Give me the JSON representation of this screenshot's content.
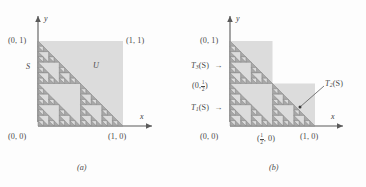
{
  "figure": {
    "type": "sierpinski-triangle-iterated-function-system",
    "panels": [
      {
        "id": "a",
        "caption": "(a)",
        "axis_x_label": "x",
        "axis_y_label": "y",
        "set_label": "S",
        "square_label": "U",
        "corner_labels": {
          "origin": "(0, 0)",
          "top_left": "(0, 1)",
          "top_right": "(1, 1)",
          "bottom_right": "(1, 0)"
        }
      },
      {
        "id": "b",
        "caption": "(b)",
        "axis_x_label": "x",
        "axis_y_label": "y",
        "map_labels": {
          "t3": "T",
          "t3_sub": "3",
          "t3_tail": "(S)",
          "t1": "T",
          "t1_sub": "1",
          "t1_tail": "(S)",
          "t2": "T",
          "t2_sub": "2",
          "t2_tail": "(S)",
          "arrow": "→"
        },
        "corner_labels": {
          "origin": "(0, 0)",
          "top_left": "(0, 1)",
          "bottom_right": "(1, 0)"
        },
        "half_y_label_open": "(0,",
        "half_y_label_num": "1",
        "half_y_label_den": "2",
        "half_y_label_close": ")",
        "half_x_label_open": "(",
        "half_x_label_num": "1",
        "half_x_label_den": "2",
        "half_x_label_close": ", 0)"
      }
    ],
    "colors": {
      "background": "#fdfdfd",
      "square_fill": "#dcdcdc",
      "fractal_fill": "#a8a8a8",
      "fractal_stroke": "#6e6e6e",
      "axis": "#5a5a5a",
      "text": "#4a4a4a"
    },
    "geometry": {
      "unit_px": 85,
      "recursion_depth": 4
    }
  }
}
